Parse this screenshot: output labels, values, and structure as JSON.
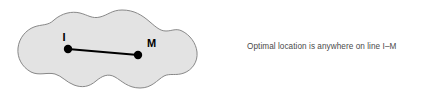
{
  "figure": {
    "background_color": "#ffffff",
    "region": {
      "name": "service-region-blob",
      "fill_color": "#e3e3e3",
      "stroke_color": "#888888",
      "stroke_width": 1
    },
    "points": [
      {
        "id": "I",
        "label": "I",
        "cx": 68,
        "cy": 49,
        "r": 4.2,
        "color": "#000000",
        "label_x": 64,
        "label_y": 41
      },
      {
        "id": "M",
        "label": "M",
        "cx": 138,
        "cy": 55,
        "r": 4.2,
        "color": "#000000",
        "label_x": 147,
        "label_y": 47
      }
    ],
    "segment": {
      "name": "optimal-line-segment",
      "from": "I",
      "to": "M",
      "x1": 68,
      "y1": 49,
      "x2": 138,
      "y2": 55,
      "color": "#000000",
      "width": 2
    },
    "caption": "Optimal location is anywhere on line I–M"
  }
}
